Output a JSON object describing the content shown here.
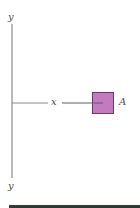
{
  "diagram": {
    "labels": {
      "y_top": "y",
      "y_bottom": "y",
      "x_axis": "x",
      "block": "A"
    },
    "colors": {
      "axis_line": "#8a8a8a",
      "block_fill": "#c27bbf",
      "block_stroke": "#6b3a68",
      "bottom_bar": "#2f3a33"
    }
  }
}
